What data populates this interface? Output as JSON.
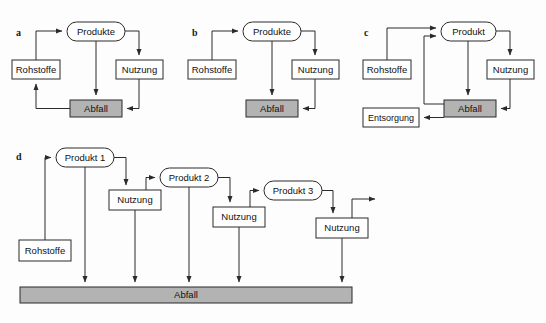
{
  "figure": {
    "type": "diagram",
    "background_color": "#fdfdfd",
    "line_color": "#2b2b2b",
    "box_fill": "#ffffff",
    "waste_fill": "#b3b3b3",
    "panels": [
      {
        "id": "a",
        "label": "a",
        "label_x": 16,
        "label_y": 36,
        "nodes": [
          {
            "name": "produkte",
            "label": "Produkte",
            "shape": "rounded",
            "x": 67,
            "y": 22,
            "w": 58,
            "h": 19,
            "fill": "white"
          },
          {
            "name": "rohstoffe",
            "label": "Rohstoffe",
            "shape": "rect",
            "x": 12,
            "y": 60,
            "w": 48,
            "h": 19,
            "fill": "white"
          },
          {
            "name": "nutzung",
            "label": "Nutzung",
            "shape": "rect",
            "x": 116,
            "y": 60,
            "w": 47,
            "h": 19,
            "fill": "white"
          },
          {
            "name": "abfall",
            "label": "Abfall",
            "shape": "rect",
            "x": 70,
            "y": 100,
            "w": 52,
            "h": 17,
            "fill": "gray"
          }
        ],
        "edges": [
          {
            "name": "rohstoffe-to-produkte",
            "from": "rohstoffe",
            "to": "produkte"
          },
          {
            "name": "produkte-to-nutzung",
            "from": "produkte",
            "to": "nutzung"
          },
          {
            "name": "produkte-to-abfall",
            "from": "produkte",
            "to": "abfall"
          },
          {
            "name": "nutzung-to-abfall",
            "from": "nutzung",
            "to": "abfall"
          },
          {
            "name": "abfall-to-rohstoffe",
            "from": "abfall",
            "to": "rohstoffe"
          }
        ]
      },
      {
        "id": "b",
        "label": "b",
        "label_x": 192,
        "label_y": 36,
        "nodes": [
          {
            "name": "produkte",
            "label": "Produkte",
            "shape": "rounded",
            "x": 243,
            "y": 22,
            "w": 58,
            "h": 19,
            "fill": "white"
          },
          {
            "name": "rohstoffe",
            "label": "Rohstoffe",
            "shape": "rect",
            "x": 188,
            "y": 60,
            "w": 48,
            "h": 19,
            "fill": "white"
          },
          {
            "name": "nutzung",
            "label": "Nutzung",
            "shape": "rect",
            "x": 292,
            "y": 60,
            "w": 47,
            "h": 19,
            "fill": "white"
          },
          {
            "name": "abfall",
            "label": "Abfall",
            "shape": "rect",
            "x": 246,
            "y": 100,
            "w": 52,
            "h": 17,
            "fill": "gray"
          }
        ],
        "edges": [
          {
            "name": "rohstoffe-to-produkte",
            "from": "rohstoffe",
            "to": "produkte"
          },
          {
            "name": "produkte-to-nutzung",
            "from": "produkte",
            "to": "nutzung"
          },
          {
            "name": "produkte-to-abfall",
            "from": "produkte",
            "to": "abfall"
          },
          {
            "name": "nutzung-to-abfall",
            "from": "nutzung",
            "to": "abfall"
          }
        ]
      },
      {
        "id": "c",
        "label": "c",
        "label_x": 364,
        "label_y": 36,
        "nodes": [
          {
            "name": "produkt",
            "label": "Produkt",
            "shape": "rounded",
            "x": 441,
            "y": 22,
            "w": 55,
            "h": 19,
            "fill": "white"
          },
          {
            "name": "rohstoffe",
            "label": "Rohstoffe",
            "shape": "rect",
            "x": 363,
            "y": 60,
            "w": 48,
            "h": 19,
            "fill": "white"
          },
          {
            "name": "nutzung",
            "label": "Nutzung",
            "shape": "rect",
            "x": 487,
            "y": 60,
            "w": 47,
            "h": 19,
            "fill": "white"
          },
          {
            "name": "abfall",
            "label": "Abfall",
            "shape": "rect",
            "x": 444,
            "y": 100,
            "w": 52,
            "h": 17,
            "fill": "gray"
          },
          {
            "name": "entsorgung",
            "label": "Entsorgung",
            "shape": "rect",
            "x": 363,
            "y": 108,
            "w": 56,
            "h": 19,
            "fill": "white"
          }
        ],
        "edges": [
          {
            "name": "rohstoffe-to-produkt",
            "from": "rohstoffe",
            "to": "produkt"
          },
          {
            "name": "produkt-to-nutzung",
            "from": "produkt",
            "to": "nutzung"
          },
          {
            "name": "produkt-to-abfall",
            "from": "produkt",
            "to": "abfall"
          },
          {
            "name": "nutzung-to-abfall",
            "from": "nutzung",
            "to": "abfall"
          },
          {
            "name": "abfall-to-produkt-recycling",
            "from": "abfall",
            "to": "produkt"
          },
          {
            "name": "abfall-to-entsorgung",
            "from": "abfall",
            "to": "entsorgung"
          }
        ]
      },
      {
        "id": "d",
        "label": "d",
        "label_x": 16,
        "label_y": 156,
        "nodes": [
          {
            "name": "produkt-1",
            "label": "Produkt 1",
            "shape": "rounded",
            "x": 56,
            "y": 148,
            "w": 58,
            "h": 19,
            "fill": "white"
          },
          {
            "name": "nutzung-1",
            "label": "Nutzung",
            "shape": "rect",
            "x": 109,
            "y": 190,
            "w": 52,
            "h": 20,
            "fill": "white"
          },
          {
            "name": "produkt-2",
            "label": "Produkt 2",
            "shape": "rounded",
            "x": 160,
            "y": 168,
            "w": 58,
            "h": 19,
            "fill": "white"
          },
          {
            "name": "nutzung-2",
            "label": "Nutzung",
            "shape": "rect",
            "x": 213,
            "y": 207,
            "w": 52,
            "h": 20,
            "fill": "white"
          },
          {
            "name": "produkt-3",
            "label": "Produkt 3",
            "shape": "rounded",
            "x": 264,
            "y": 181,
            "w": 58,
            "h": 19,
            "fill": "white"
          },
          {
            "name": "nutzung-3",
            "label": "Nutzung",
            "shape": "rect",
            "x": 307,
            "y": 218,
            "w": 52,
            "h": 20,
            "fill": "white"
          },
          {
            "name": "rohstoffe",
            "label": "Rohstoffe",
            "shape": "rect",
            "x": 19,
            "y": 240,
            "w": 52,
            "h": 21,
            "fill": "white"
          },
          {
            "name": "abfall-bar",
            "label": "Abfall",
            "shape": "bar",
            "x": 20,
            "y": 287,
            "w": 332,
            "h": 16,
            "fill": "gray"
          }
        ],
        "edges": [
          {
            "name": "rohstoffe-to-produkt-1",
            "from": "rohstoffe",
            "to": "produkt-1"
          },
          {
            "name": "produkt-1-to-nutzung-1",
            "from": "produkt-1",
            "to": "nutzung-1"
          },
          {
            "name": "nutzung-1-to-produkt-2",
            "from": "nutzung-1",
            "to": "produkt-2"
          },
          {
            "name": "produkt-2-to-nutzung-2",
            "from": "produkt-2",
            "to": "nutzung-2"
          },
          {
            "name": "nutzung-2-to-produkt-3",
            "from": "nutzung-2",
            "to": "produkt-3"
          },
          {
            "name": "produkt-3-to-nutzung-3",
            "from": "produkt-3",
            "to": "nutzung-3"
          },
          {
            "name": "nutzung-3-to-export",
            "from": "nutzung-3",
            "to": "export-arrow"
          },
          {
            "name": "produkt-1-to-abfall",
            "from": "produkt-1",
            "to": "abfall-bar"
          },
          {
            "name": "nutzung-1-to-abfall",
            "from": "nutzung-1",
            "to": "abfall-bar"
          },
          {
            "name": "produkt-2-to-abfall",
            "from": "produkt-2",
            "to": "abfall-bar"
          },
          {
            "name": "nutzung-2-to-abfall",
            "from": "nutzung-2",
            "to": "abfall-bar"
          },
          {
            "name": "nutzung-3-to-abfall",
            "from": "nutzung-3",
            "to": "abfall-bar"
          }
        ]
      }
    ],
    "labels": {
      "produkte": "Produkte",
      "produkt": "Produkt",
      "rohstoffe": "Rohstoffe",
      "nutzung": "Nutzung",
      "abfall": "Abfall",
      "entsorgung": "Entsorgung",
      "produkt_1": "Produkt 1",
      "produkt_2": "Produkt 2",
      "produkt_3": "Produkt 3",
      "panel_a": "a",
      "panel_b": "b",
      "panel_c": "c",
      "panel_d": "d"
    }
  }
}
